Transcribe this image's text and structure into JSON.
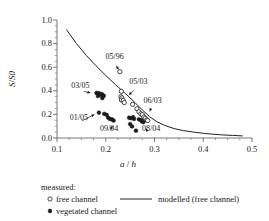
{
  "chart_data": {
    "type": "scatter",
    "title": "",
    "xlabel": "a / h",
    "xlabel_symbol": "a",
    "xlabel_denominator": "h",
    "ylabel": "S/S0",
    "ylabel_numerator": "S",
    "ylabel_denominator": "S",
    "ylabel_subscript": "0",
    "xlim": [
      0.1,
      0.5
    ],
    "ylim": [
      0.0,
      1.0
    ],
    "xticks": [
      0.1,
      0.2,
      0.3,
      0.4,
      0.5
    ],
    "xtick_labels": [
      "0.1",
      "0.2",
      "0.3",
      "0.4",
      "0.5"
    ],
    "xminor_ticks": [
      0.125,
      0.15,
      0.175,
      0.225,
      0.25,
      0.275,
      0.325,
      0.35,
      0.375,
      0.425,
      0.45,
      0.475
    ],
    "yticks": [
      0.0,
      0.2,
      0.4,
      0.6,
      0.8,
      1.0
    ],
    "ytick_labels": [
      "0.0",
      "0.2",
      "0.4",
      "0.6",
      "0.8",
      "1.0"
    ],
    "yminor_ticks": [
      0.05,
      0.1,
      0.15,
      0.25,
      0.3,
      0.35,
      0.45,
      0.5,
      0.55,
      0.65,
      0.7,
      0.75,
      0.85,
      0.9,
      0.95
    ],
    "grid": false,
    "legend_position": "below-left",
    "series": [
      {
        "name": "free channel",
        "marker": "open-circle",
        "color": "#1a1a1a",
        "points": [
          [
            0.232,
            0.395
          ],
          [
            0.231,
            0.35
          ],
          [
            0.233,
            0.34
          ],
          [
            0.232,
            0.322
          ],
          [
            0.236,
            0.318
          ],
          [
            0.238,
            0.3
          ],
          [
            0.255,
            0.285
          ],
          [
            0.264,
            0.248
          ],
          [
            0.268,
            0.222
          ],
          [
            0.272,
            0.205
          ],
          [
            0.275,
            0.198
          ],
          [
            0.278,
            0.178
          ],
          [
            0.281,
            0.168
          ],
          [
            0.284,
            0.155
          ],
          [
            0.286,
            0.148
          ],
          [
            0.229,
            0.562
          ]
        ]
      },
      {
        "name": "vegetated channel",
        "marker": "filled-circle",
        "color": "#1a1a1a",
        "points": [
          [
            0.181,
            0.382
          ],
          [
            0.186,
            0.38
          ],
          [
            0.184,
            0.356
          ],
          [
            0.19,
            0.366
          ],
          [
            0.192,
            0.372
          ],
          [
            0.196,
            0.358
          ],
          [
            0.193,
            0.338
          ],
          [
            0.186,
            0.215
          ],
          [
            0.197,
            0.205
          ],
          [
            0.202,
            0.196
          ],
          [
            0.205,
            0.172
          ],
          [
            0.209,
            0.16
          ],
          [
            0.213,
            0.158
          ],
          [
            0.216,
            0.148
          ],
          [
            0.248,
            0.172
          ],
          [
            0.252,
            0.168
          ],
          [
            0.256,
            0.176
          ],
          [
            0.258,
            0.162
          ],
          [
            0.25,
            0.118
          ],
          [
            0.254,
            0.098
          ],
          [
            0.262,
            0.062
          ],
          [
            0.268,
            0.158
          ],
          [
            0.272,
            0.152
          ],
          [
            0.274,
            0.142
          ],
          [
            0.277,
            0.134
          ]
        ]
      }
    ],
    "model_curve": {
      "name": "modelled (free channel)",
      "description": "decreasing curve from upper-left to lower-right",
      "points": [
        [
          0.12,
          0.915
        ],
        [
          0.14,
          0.8
        ],
        [
          0.16,
          0.7
        ],
        [
          0.18,
          0.612
        ],
        [
          0.2,
          0.53
        ],
        [
          0.22,
          0.452
        ],
        [
          0.24,
          0.378
        ],
        [
          0.26,
          0.3
        ],
        [
          0.275,
          0.238
        ],
        [
          0.29,
          0.18
        ],
        [
          0.305,
          0.138
        ],
        [
          0.32,
          0.108
        ],
        [
          0.34,
          0.08
        ],
        [
          0.36,
          0.062
        ],
        [
          0.38,
          0.05
        ],
        [
          0.4,
          0.04
        ],
        [
          0.42,
          0.032
        ],
        [
          0.44,
          0.026
        ],
        [
          0.46,
          0.022
        ],
        [
          0.48,
          0.018
        ]
      ]
    },
    "annotations": [
      {
        "text": "05/96",
        "label_x": 0.216,
        "label_y": 0.645,
        "target_x": 0.229,
        "target_y": 0.565,
        "arrow": "down-right"
      },
      {
        "text": "05/03",
        "label_x": 0.265,
        "label_y": 0.432,
        "target_x": 0.244,
        "target_y": 0.352,
        "arrow": "down-left"
      },
      {
        "text": "06/03",
        "label_x": 0.294,
        "label_y": 0.268,
        "target_x": 0.289,
        "target_y": 0.208,
        "arrow": "down-left"
      },
      {
        "text": "08/04",
        "label_x": 0.291,
        "label_y": 0.032,
        "target_x": 0.279,
        "target_y": 0.092,
        "arrow": "up-left"
      },
      {
        "text": "03/05",
        "label_x": 0.146,
        "label_y": 0.402,
        "target_x": 0.173,
        "target_y": 0.38,
        "arrow": "right"
      },
      {
        "text": "01/05",
        "label_x": 0.143,
        "label_y": 0.128,
        "target_x": 0.181,
        "target_y": 0.208,
        "arrow": "up-right"
      },
      {
        "text": "09/04",
        "label_x": 0.205,
        "label_y": 0.03,
        "target_x": 0.216,
        "target_y": 0.118,
        "arrow": "up"
      }
    ]
  },
  "legend": {
    "measured_label": "measured:",
    "free_channel_label": "free channel",
    "vegetated_channel_label": "vegetated channel",
    "modelled_label": "modelled (free channel)"
  }
}
